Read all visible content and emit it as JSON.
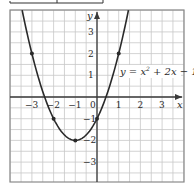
{
  "chart_data": {
    "type": "line",
    "title": "",
    "equation": "y = x² + 2x − 1",
    "xlabel": "x",
    "ylabel": "y",
    "xlim": [
      -4,
      4
    ],
    "ylim": [
      -3.9,
      4
    ],
    "grid": true,
    "grid_step": 0.5,
    "x_ticks": [
      -3,
      -2,
      -1,
      0,
      1,
      2,
      3
    ],
    "x_tick_labels": [
      "−3",
      "−2",
      "−1",
      "0",
      "1",
      "2",
      "3"
    ],
    "y_ticks": [
      3,
      2,
      1,
      -1,
      -2,
      -3
    ],
    "y_tick_labels": [
      "3",
      "2",
      "1",
      "−1",
      "−2",
      "−3"
    ],
    "series": [
      {
        "name": "y = x² + 2x − 1",
        "function": "x^2 + 2x - 1",
        "points": [
          {
            "x": -3,
            "y": 2
          },
          {
            "x": -2,
            "y": -1
          },
          {
            "x": -1,
            "y": -2
          },
          {
            "x": 0,
            "y": -1
          },
          {
            "x": 1,
            "y": 2
          }
        ]
      }
    ],
    "vertex": {
      "x": -1,
      "y": -2
    }
  },
  "labels": {
    "x_axis": "x",
    "y_axis": "y",
    "equation_prefix": "y = x",
    "equation_sup": "2",
    "equation_suffix": " + 2x − 1",
    "origin": "0"
  },
  "colors": {
    "grid": "#c8c8c8",
    "axis": "#3a3a3a",
    "curve": "#2a2a2a",
    "border": "#8a8a8a"
  }
}
